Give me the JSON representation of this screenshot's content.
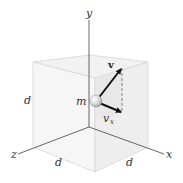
{
  "diagram": {
    "axes": {
      "x_label": "x",
      "y_label": "y",
      "z_label": "z"
    },
    "cube": {
      "side_label_left": "d",
      "side_label_bottom_left": "d",
      "side_label_bottom_right": "d"
    },
    "particle": {
      "mass_label": "m"
    },
    "vectors": {
      "velocity_label": "v",
      "component_label_main": "v",
      "component_label_sub": "x"
    },
    "colors": {
      "cube_face": "#f3f3f3",
      "cube_face_shaded": "#e9e9e9",
      "cube_edge": "#d8d8d8",
      "axis": "#555555",
      "arrow": "#111111",
      "dashed": "#777777"
    }
  }
}
